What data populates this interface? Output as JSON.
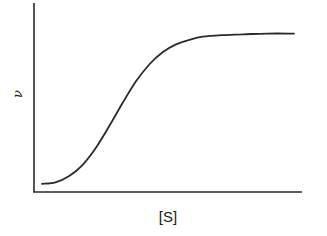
{
  "chart_data": {
    "type": "line",
    "title": "",
    "xlabel": "[S]",
    "ylabel": "ν",
    "xlim": [
      0,
      1
    ],
    "ylim": [
      0,
      1
    ],
    "grid": false,
    "legend": "none",
    "x_ticks": [],
    "y_ticks": [],
    "series": [
      {
        "name": "sigmoidal saturation curve",
        "color": "#2a2a2a",
        "x": [
          0.03,
          0.08,
          0.13,
          0.18,
          0.23,
          0.28,
          0.33,
          0.38,
          0.43,
          0.48,
          0.53,
          0.58,
          0.63,
          0.7,
          0.78,
          0.87,
          0.97
        ],
        "y": [
          0.02,
          0.03,
          0.07,
          0.14,
          0.25,
          0.39,
          0.54,
          0.68,
          0.79,
          0.87,
          0.92,
          0.95,
          0.97,
          0.98,
          0.985,
          0.99,
          0.99
        ]
      }
    ]
  }
}
